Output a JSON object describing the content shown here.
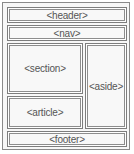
{
  "diagram": {
    "blocks": {
      "header": "<header>",
      "nav": "<nav>",
      "section": "<section>",
      "aside": "<aside>",
      "article": "<article>",
      "footer": "<footer>"
    },
    "colors": {
      "border": "#7d7d7d",
      "fill": "#f8f8f8",
      "text": "#555555"
    }
  }
}
